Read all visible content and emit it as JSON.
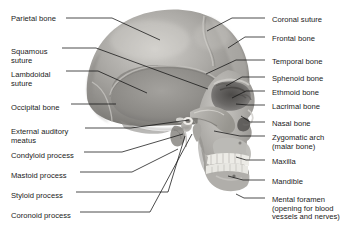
{
  "figure": {
    "background_color": "#ffffff",
    "text_color": "#1a1a1a",
    "leader_line_color": "#111111",
    "bone_light": "#d8d6d2",
    "bone_mid": "#9d9b97",
    "bone_dark": "#6e6c69",
    "tooth_color": "#f4f3ef"
  },
  "labels_left": [
    {
      "id": "parietal-bone",
      "text": "Parietal bone",
      "x": 11,
      "y": 15
    },
    {
      "id": "squamous-suture",
      "text": "Squamous\nsuture",
      "x": 11,
      "y": 48
    },
    {
      "id": "lambdoidal-suture",
      "text": "Lambdoidal\nsuture",
      "x": 11,
      "y": 71
    },
    {
      "id": "occipital-bone",
      "text": "Occipital bone",
      "x": 11,
      "y": 104
    },
    {
      "id": "external-auditory-meatus",
      "text": "External auditory\nmeatus",
      "x": 11,
      "y": 128
    },
    {
      "id": "condyloid-process",
      "text": "Condyloid process",
      "x": 11,
      "y": 152
    },
    {
      "id": "mastoid-process",
      "text": "Mastoid process",
      "x": 11,
      "y": 172
    },
    {
      "id": "styloid-process",
      "text": "Styloid process",
      "x": 11,
      "y": 192
    },
    {
      "id": "coronoid-process",
      "text": "Coronoid process",
      "x": 11,
      "y": 212
    }
  ],
  "labels_right": [
    {
      "id": "coronal-suture",
      "text": "Coronal suture",
      "x": 272,
      "y": 16
    },
    {
      "id": "frontal-bone",
      "text": "Frontal bone",
      "x": 272,
      "y": 35
    },
    {
      "id": "temporal-bone",
      "text": "Temporal bone",
      "x": 272,
      "y": 58
    },
    {
      "id": "sphenoid-bone",
      "text": "Sphenoid bone",
      "x": 272,
      "y": 75
    },
    {
      "id": "ethmoid-bone",
      "text": "Ethmoid bone",
      "x": 272,
      "y": 89
    },
    {
      "id": "lacrimal-bone",
      "text": "Lacrimal bone",
      "x": 272,
      "y": 103
    },
    {
      "id": "nasal-bone",
      "text": "Nasal bone",
      "x": 272,
      "y": 120
    },
    {
      "id": "zygomatic-arch",
      "text": "Zygomatic arch\n(malar bone)",
      "x": 272,
      "y": 134
    },
    {
      "id": "maxilla",
      "text": "Maxilla",
      "x": 272,
      "y": 158
    },
    {
      "id": "mandible",
      "text": "Mandible",
      "x": 272,
      "y": 178
    },
    {
      "id": "mental-foramen",
      "text": "Mental foramen\n(opening for blood\nvessels and nerves)",
      "x": 272,
      "y": 196
    }
  ],
  "leader_lines": [
    {
      "id": "leader-parietal-bone",
      "points": "66,18 112,18 160,40"
    },
    {
      "id": "leader-squamous-suture",
      "points": "62,48 96,48 208,89"
    },
    {
      "id": "leader-lambdoidal-suture",
      "points": "66,71 98,71 147,93"
    },
    {
      "id": "leader-occipital-bone",
      "points": "71,104 116,104"
    },
    {
      "id": "leader-external-auditory-meatus",
      "points": "85,128 131,128 189,120"
    },
    {
      "id": "leader-condyloid-process",
      "points": "84,152 122,152 183,134"
    },
    {
      "id": "leader-mastoid-process",
      "points": "80,172 132,172 178,149"
    },
    {
      "id": "leader-styloid-process",
      "points": "76,192 168,192 185,136"
    },
    {
      "id": "leader-coronoid-process",
      "points": "80,212 150,212 192,134"
    },
    {
      "id": "leader-coronal-suture",
      "points": "265,18 232,18 207,31"
    },
    {
      "id": "leader-frontal-bone",
      "points": "265,37 245,37 228,48"
    },
    {
      "id": "leader-temporal-bone",
      "points": "265,60 236,60 206,74"
    },
    {
      "id": "leader-sphenoid-bone",
      "points": "265,77 242,77 226,86"
    },
    {
      "id": "leader-ethmoid-bone",
      "points": "265,91 246,91 232,98"
    },
    {
      "id": "leader-lacrimal-bone",
      "points": "265,105 248,105 236,104"
    },
    {
      "id": "leader-nasal-bone",
      "points": "265,122 250,122 241,116"
    },
    {
      "id": "leader-zygomatic-arch",
      "points": "265,136 240,136 214,131"
    },
    {
      "id": "leader-maxilla",
      "points": "265,160 246,160 236,157"
    },
    {
      "id": "leader-mandible",
      "points": "265,180 243,180 228,176"
    },
    {
      "id": "leader-mental-foramen",
      "points": "265,198 244,198 236,194"
    }
  ]
}
